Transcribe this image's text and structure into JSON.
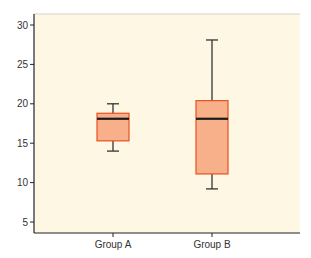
{
  "chart_data": {
    "type": "box",
    "title": "",
    "xlabel": "",
    "ylabel": "",
    "ylim": [
      3.5,
      31.5
    ],
    "yticks": [
      5,
      10,
      15,
      20,
      25,
      30
    ],
    "categories": [
      "Group A",
      "Group B"
    ],
    "series": [
      {
        "name": "Group A",
        "whisker_low": 14,
        "q1": 15.3,
        "median": 18.1,
        "q3": 18.8,
        "whisker_high": 20
      },
      {
        "name": "Group B",
        "whisker_low": 9.2,
        "q1": 11.1,
        "median": 18.1,
        "q3": 20.4,
        "whisker_high": 28.1
      }
    ],
    "grid": false,
    "legend": null,
    "colors": {
      "plot_background": "#fdf7e4",
      "box_fill": "#f7b08a",
      "box_edge": "#e8501e",
      "median_line": "#1a1a1a",
      "whisker": "#333333",
      "axis": "#222222"
    }
  }
}
